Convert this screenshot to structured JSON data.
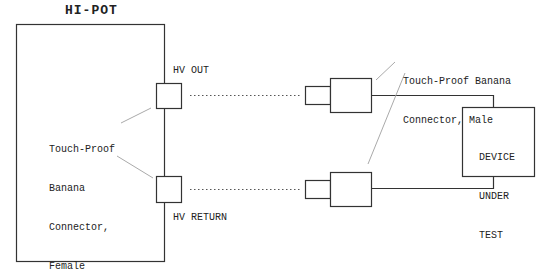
{
  "diagram": {
    "title": "HI-POT",
    "hv_out_label": "HV OUT",
    "hv_return_label": "HV RETURN",
    "female_connector_label": {
      "lines": [
        "Touch-Proof",
        "Banana",
        "Connector,",
        "Female"
      ]
    },
    "male_connector_label": {
      "lines": [
        "Touch-Proof Banana",
        "Connector, Male"
      ]
    },
    "dut_label": {
      "lines": [
        "DEVICE",
        "UNDER",
        "TEST"
      ]
    },
    "colors": {
      "stroke": "#333333",
      "leader": "#aaaaaa",
      "background": "#ffffff"
    }
  }
}
